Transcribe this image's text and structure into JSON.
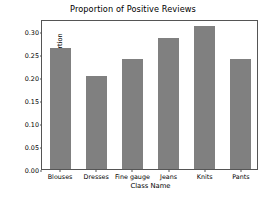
{
  "chart_data": {
    "type": "bar",
    "title": "Proportion of Positive Reviews",
    "xlabel": "Class Name",
    "ylabel": "Positive Proportion",
    "categories": [
      "Blouses",
      "Dresses",
      "Fine gauge",
      "Jeans",
      "Knits",
      "Pants"
    ],
    "values": [
      0.263,
      0.201,
      0.238,
      0.283,
      0.309,
      0.238
    ],
    "ylim": [
      0.0,
      0.325
    ],
    "yticks": [
      0.0,
      0.05,
      0.1,
      0.15,
      0.2,
      0.25,
      0.3
    ],
    "ytick_labels": [
      "0.00",
      "0.05",
      "0.10",
      "0.15",
      "0.20",
      "0.25",
      "0.30"
    ],
    "grid": false,
    "legend": null,
    "bar_color": "#808080",
    "axes_color": "#555555",
    "background": "#ffffff"
  }
}
